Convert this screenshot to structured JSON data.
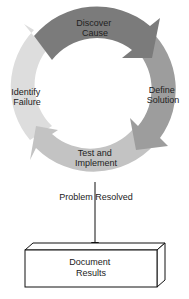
{
  "cycle": {
    "steps": [
      {
        "label_line1": "Discover",
        "label_line2": "Cause",
        "color": "#7b7b7b"
      },
      {
        "label_line1": "Define",
        "label_line2": "Solution",
        "color": "#9d9d9d"
      },
      {
        "label_line1": "Test and",
        "label_line2": "Implement",
        "color": "#c3c3c3"
      },
      {
        "label_line1": "Identify",
        "label_line2": "Failure",
        "color": "#dddddd"
      }
    ]
  },
  "connector": {
    "label": "Problem Resolved"
  },
  "result_box": {
    "label_line1": "Document",
    "label_line2": "Results"
  }
}
